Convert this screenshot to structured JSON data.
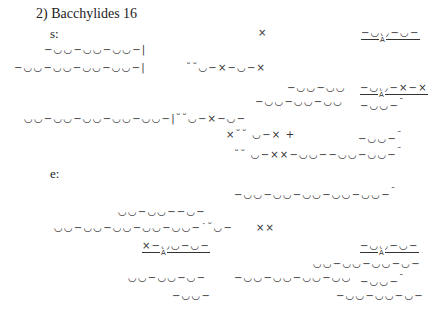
{
  "heading": "2) Bacchylides 16",
  "strophe_label": "s:",
  "epode_label": "e:",
  "strophe": [
    {
      "text": "−◡◡−◡◡−◡◡−|",
      "x": 44,
      "y": 44
    },
    {
      "text": "−◡◡−◡◡−◡◡−◡◡−|",
      "x": 14,
      "y": 62
    },
    {
      "text": "˘˘◡−×−◡−×",
      "x": 186,
      "y": 62
    },
    {
      "text": "×",
      "x": 258,
      "y": 27
    },
    {
      "text": "−◡◡−◡−",
      "x": 361,
      "y": 27,
      "underline": true,
      "mark": "A"
    },
    {
      "text": "−◡◡−◡◡",
      "x": 287,
      "y": 82
    },
    {
      "text": "−◡◡−×−×",
      "x": 360,
      "y": 82,
      "underline": true,
      "mark": "A"
    },
    {
      "text": "−◡◡−◡◡−◡◡",
      "x": 255,
      "y": 96
    },
    {
      "text": "−◡◡−",
      "x": 360,
      "y": 96,
      "suffix": "¯"
    },
    {
      "text": "◡◡−◡◡−◡◡−◡◡−◡◡−|˘˘◡−×−◡−",
      "x": 24,
      "y": 113
    },
    {
      "text": "×˘˘ ◡−× +",
      "x": 226,
      "y": 129
    },
    {
      "text": "−◡◡−",
      "x": 358,
      "y": 129,
      "suffix": "¯"
    },
    {
      "text": "˘˘ ◡−××−◡◡−−◡◡−◡◡−",
      "x": 234,
      "y": 145,
      "suffix": "¯"
    }
  ],
  "epode": [
    {
      "text": "−◡◡−◡◡−◡◡−◡◡−◡◡−",
      "x": 234,
      "y": 185,
      "suffix": "¯"
    },
    {
      "text": "◡◡−◡◡−−◡−",
      "x": 118,
      "y": 206
    },
    {
      "text": "◡◡−◡◡−◡◡−◡◡−◡◡−˙˘◡−",
      "x": 54,
      "y": 222
    },
    {
      "text": "××",
      "x": 256,
      "y": 222
    },
    {
      "text": "×−◡◡−◡−",
      "x": 142,
      "y": 240,
      "underline": true,
      "mark": "A"
    },
    {
      "text": "−◡◡−◡−",
      "x": 360,
      "y": 240,
      "underline": true,
      "mark": "A"
    },
    {
      "text": "◡◡−◡◡−◡◡−◡−",
      "x": 313,
      "y": 258
    },
    {
      "text": "◡◡−◡◡−◡−",
      "x": 128,
      "y": 272
    },
    {
      "text": "−◡◡−◡◡−◡◡−◡◡",
      "x": 234,
      "y": 272
    },
    {
      "text": "−◡◡−",
      "x": 360,
      "y": 272,
      "suffix": "¯"
    },
    {
      "text": "−◡◡−",
      "x": 172,
      "y": 290
    },
    {
      "text": "−◡◡−◡◡−◡−",
      "x": 336,
      "y": 290
    }
  ]
}
